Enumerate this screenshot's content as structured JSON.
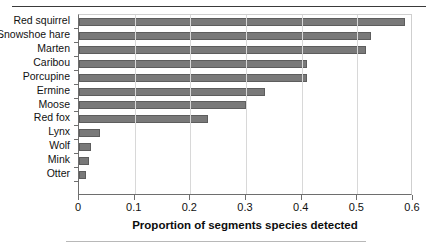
{
  "chart_data": {
    "type": "bar",
    "orientation": "horizontal",
    "title": "",
    "xlabel": "Proportion of segments species detected",
    "ylabel": "",
    "categories": [
      "Red squirrel",
      "Snowshoe hare",
      "Marten",
      "Caribou",
      "Porcupine",
      "Ermine",
      "Moose",
      "Red fox",
      "Lynx",
      "Wolf",
      "Mink",
      "Otter"
    ],
    "values": [
      0.585,
      0.525,
      0.515,
      0.41,
      0.41,
      0.335,
      0.3,
      0.232,
      0.038,
      0.021,
      0.018,
      0.012
    ],
    "xlim": [
      0,
      0.6
    ],
    "xticks": [
      0,
      0.1,
      0.2,
      0.3,
      0.4,
      0.5,
      0.6
    ],
    "xtick_labels": [
      "0",
      "0.1",
      "0.2",
      "0.3",
      "0.4",
      "0.5",
      "0.6"
    ],
    "grid": "vertical",
    "legend": "none",
    "bar_color": "#797979",
    "bar_edge_color": "#5d5d5d"
  }
}
